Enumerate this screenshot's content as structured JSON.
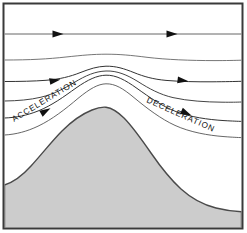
{
  "figure": {
    "name": "airflow-over-mountain-diagram",
    "title": "Airflow streamlines over a mountain ridge",
    "background_color": "#ffffff"
  },
  "frame": {
    "name": "diagram-border",
    "x": 3.5,
    "y": 3.5,
    "width": 239,
    "height": 225,
    "stroke_color": "#3a3a3a",
    "stroke_width": 2,
    "fill_color": "#ffffff"
  },
  "terrain": {
    "label": "mountain",
    "fill_color": "#cccccc",
    "stroke_color": "#4a4a4a",
    "stroke_width": 1.4,
    "peak": {
      "x": 105,
      "y": 107
    },
    "path": "M 4.5 228 L 4.5 185 C 14 182 22 176 31 166 C 42 154 52 141 62 131 C 72 121 82 114 92 110 C 98 107.5 102 106.8 106 107.2 C 112 108 118 112 124 118 C 133 127 142 140 151 153 C 160 166 170 179 181 189 C 192 199 204 205 216 208 C 226 210.5 235 211.5 241.5 211.8 L 241.5 228 Z"
  },
  "streamlines": [
    {
      "id": "streamline-1",
      "description": "uppermost streamline, straight and horizontal, undisturbed flow",
      "stroke_color": "#555555",
      "stroke_width": 0.9,
      "path": "M 4.5 34 L 241.5 34",
      "arrows": [
        {
          "x": 58,
          "y": 34,
          "angle": 0
        },
        {
          "x": 172,
          "y": 34,
          "angle": 0
        }
      ]
    },
    {
      "id": "streamline-2",
      "description": "second streamline, gentle broad crest over the mountain",
      "stroke_color": "#666666",
      "stroke_width": 0.9,
      "path": "M 4.5 60 C 30 60 48 59 66 57 C 82 55.3 93 54.2 106 54.2 C 120 54.2 131 55.3 147 57.3 C 166 59.6 190 60.6 215 60.6 C 226 60.6 235 60.4 241.5 60.2",
      "arrows": []
    },
    {
      "id": "streamline-3",
      "description": "third streamline, pronounced crest with arrowheads",
      "stroke_color": "#333333",
      "stroke_width": 1.0,
      "path": "M 4.5 81.5 C 20 81.5 34 81.2 46 80.3 C 60 79.2 70 76.6 80 72.7 C 90 68.8 97 66.5 106 66.2 C 116 66 124 68.6 134 72.6 C 144 76.6 153 79.2 166 80.4 C 180 81.6 196 81.9 212 81.8 C 225 81.7 235 81.5 241.5 81.3",
      "arrows": [
        {
          "x": 55,
          "y": 79.4,
          "angle": -11
        },
        {
          "x": 183,
          "y": 81.3,
          "angle": 7
        }
      ]
    },
    {
      "id": "streamline-4",
      "description": "fourth streamline, steeper crest following the terrain, no arrowheads",
      "stroke_color": "#444444",
      "stroke_width": 1.0,
      "path": "M 4.5 101 C 18 100.8 30 99.8 41 97.2 C 54 94 64 88.6 74 82.6 C 86 75.4 95 71.4 106 71 C 117 70.6 127 74.8 138 81.6 C 149 88.6 160 94.6 173 97.6 C 188 101 206 102 222 102.2 C 231 102.3 237 102.2 241.5 102",
      "arrows": []
    },
    {
      "id": "streamline-5",
      "description": "fifth streamline, bends sharply over peak, carries ACCELERATION and DECELERATION arrowheads",
      "stroke_color": "#333333",
      "stroke_width": 1.0,
      "path": "M 4.5 118 C 16 117.6 27 115.4 38 111 C 52 105.4 64 96.6 76 88 C 88 79.6 97 75.4 106 75.2 C 116 75 125 79.8 137 88.4 C 150 97.6 162 106.2 176 111.6 C 190 117 208 119.6 224 120.6 C 233 121.1 238 121.3 241.5 121.4",
      "arrows": [
        {
          "x": 45,
          "y": 108.2,
          "angle": -30
        },
        {
          "x": 186,
          "y": 115.4,
          "angle": 24
        }
      ]
    },
    {
      "id": "streamline-6",
      "description": "lowest streamline, hugs the mountain slope",
      "stroke_color": "#555555",
      "stroke_width": 0.9,
      "path": "M 4.5 135 C 16 134.4 27 131.4 38 126.2 C 52 119.6 66 108.6 78 98.4 C 90 88.6 98 84 106 83.8 C 115 83.6 123 88.4 134 97.6 C 147 108.4 161 119 175 125.4 C 190 132.2 208 135.4 224 136.6 C 233 137.3 238 137.5 241.5 137.6",
      "arrows": []
    }
  ],
  "labels": [
    {
      "id": "acceleration-label",
      "text": "ACCELERATION",
      "x": 14,
      "y": 122,
      "rotation": -31,
      "color": "#111111"
    },
    {
      "id": "deceleration-label",
      "text": "DECELERATION",
      "x": 146,
      "y": 102,
      "rotation": 24,
      "color": "#111111"
    }
  ],
  "arrow_style": {
    "fill_color": "#111111",
    "length": 11,
    "half_width": 3.4
  }
}
